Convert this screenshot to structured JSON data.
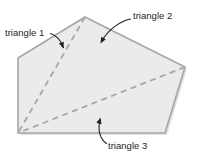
{
  "figure": {
    "background_color": "#ffffff",
    "polygon": {
      "name": "pentagon",
      "fill_color": "#ebebeb",
      "stroke_color": "#a6a6a6",
      "shadow_color": "#c9c9c9",
      "stroke_width": 1.6,
      "vertices": [
        {
          "label": "left-upper",
          "x": 18,
          "y": 58
        },
        {
          "label": "apex",
          "x": 85,
          "y": 17
        },
        {
          "label": "right",
          "x": 185,
          "y": 67
        },
        {
          "label": "bottom-right",
          "x": 165,
          "y": 133
        },
        {
          "label": "bottom-left",
          "x": 18,
          "y": 133
        }
      ]
    },
    "diagonals": [
      {
        "name": "diagonal-apex-to-bottom-left",
        "from": {
          "x": 85,
          "y": 17
        },
        "to": {
          "x": 18,
          "y": 133
        },
        "style": "dashed",
        "color": "#a6a6a6"
      },
      {
        "name": "diagonal-right-to-bottom-left",
        "from": {
          "x": 185,
          "y": 67
        },
        "to": {
          "x": 18,
          "y": 133
        },
        "style": "dashed",
        "color": "#a6a6a6"
      }
    ],
    "labels": [
      {
        "id": "triangle-1",
        "text": "triangle 1",
        "text_x": 5,
        "text_y": 36,
        "arrow": {
          "name": "arrow-to-triangle-1",
          "path": "M 50.5 33.5 C 57 35.5 61 41 63.5 47.5",
          "head_x": 63.5,
          "head_y": 48.5,
          "head_angle": 70,
          "color": "#231f20"
        }
      },
      {
        "id": "triangle-2",
        "text": "triangle 2",
        "text_x": 133,
        "text_y": 19,
        "arrow": {
          "name": "arrow-to-triangle-2",
          "path": "M 130.5 19 C 120 21 108 30 101.5 41.5",
          "head_x": 100.5,
          "head_y": 43.5,
          "head_angle": 119,
          "color": "#231f20"
        }
      },
      {
        "id": "triangle-3",
        "text": "triangle 3",
        "text_x": 108,
        "text_y": 149,
        "arrow": {
          "name": "arrow-to-triangle-3",
          "path": "M 106.5 143.5 C 100 139 97.5 130 100 120",
          "head_x": 100.5,
          "head_y": 117.5,
          "head_angle": -75,
          "color": "#231f20"
        }
      }
    ]
  }
}
